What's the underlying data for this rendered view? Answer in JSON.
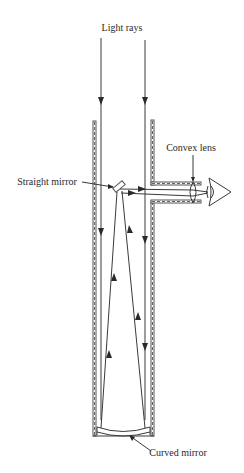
{
  "diagram": {
    "labels": {
      "light_rays": "Light rays",
      "convex_lens": "Convex lens",
      "straight_mirror": "Straight mirror",
      "curved_mirror": "Curved mirror"
    },
    "parts": [
      "tube",
      "eyepiece-tube",
      "straight-mirror",
      "curved-mirror",
      "convex-lens",
      "eye",
      "light-rays"
    ],
    "colors": {
      "line": "#3a3a3a",
      "background": "#ffffff"
    }
  }
}
